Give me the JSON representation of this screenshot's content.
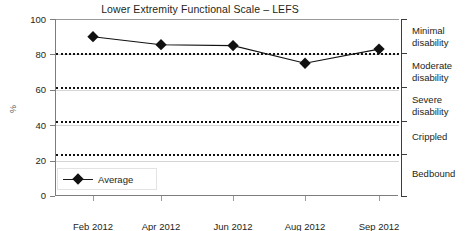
{
  "chart_data": {
    "type": "line",
    "title": "Lower Extremity Functional Scale – LEFS",
    "xlabel": "",
    "ylabel": "%",
    "ylim": [
      0,
      100
    ],
    "yticks": [
      0,
      20,
      40,
      60,
      80,
      100
    ],
    "grid": true,
    "legend_position": "inside-bottom-left",
    "categories": [
      "Feb 2012",
      "Apr 2012",
      "Jun 2012",
      "Aug 2012",
      "Sep 2012"
    ],
    "series": [
      {
        "name": "Average",
        "marker": "diamond",
        "color": "#111111",
        "values": [
          90,
          85.5,
          85,
          75,
          83
        ]
      }
    ],
    "threshold_lines": [
      {
        "label": "Minimal disability lower bound",
        "value": 81
      },
      {
        "label": "Moderate disability lower bound",
        "value": 61.5
      },
      {
        "label": "Severe disability lower bound",
        "value": 42.5
      },
      {
        "label": "Crippled lower bound",
        "value": 23.5
      }
    ],
    "category_bands": [
      {
        "label": "Minimal disability",
        "range": [
          81,
          100
        ]
      },
      {
        "label": "Moderate disability",
        "range": [
          61.5,
          81
        ]
      },
      {
        "label": "Severe disability",
        "range": [
          42.5,
          61.5
        ]
      },
      {
        "label": "Crippled",
        "range": [
          23.5,
          42.5
        ]
      },
      {
        "label": "Bedbound",
        "range": [
          0,
          23.5
        ]
      }
    ]
  },
  "axis": {
    "y_title": "%",
    "y_tick_labels": [
      "100",
      "80",
      "60",
      "40",
      "20",
      "0"
    ],
    "x_tick_labels": [
      "Feb 2012",
      "Apr 2012",
      "Jun 2012",
      "Aug 2012",
      "Sep 2012"
    ]
  },
  "legend": {
    "series_label": "Average"
  },
  "bands": {
    "minimal": "Minimal\ndisability",
    "minimal_line1": "Minimal",
    "minimal_line2": "disability",
    "moderate_line1": "Moderate",
    "moderate_line2": "disability",
    "severe_line1": "Severe",
    "severe_line2": "disability",
    "crippled": "Crippled",
    "bedbound": "Bedbound"
  },
  "colors": {
    "series": "#111111",
    "axis": "#7d7d7d",
    "grid": "#d4d4d4",
    "threshold": "#111111",
    "text": "#231f20"
  }
}
